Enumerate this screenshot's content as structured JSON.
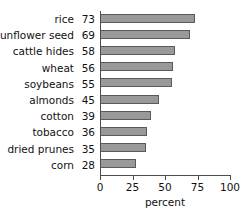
{
  "chart_data": {
    "type": "bar",
    "orientation": "horizontal",
    "title": "",
    "xlabel": "percent",
    "ylabel": "",
    "xlim": [
      0,
      100
    ],
    "xticks": [
      0,
      25,
      50,
      75,
      100
    ],
    "grid": false,
    "legend": null,
    "categories": [
      "rice",
      "sunflower seed",
      "cattle hides",
      "wheat",
      "soybeans",
      "almonds",
      "cotton",
      "tobacco",
      "dried prunes",
      "corn"
    ],
    "values": [
      73,
      69,
      58,
      56,
      55,
      45,
      39,
      36,
      35,
      28
    ],
    "rows": [
      {
        "category": "rice",
        "value": 73,
        "value_text": "73"
      },
      {
        "category": "sunflower seed",
        "value": 69,
        "value_text": "69"
      },
      {
        "category": "cattle hides",
        "value": 58,
        "value_text": "58"
      },
      {
        "category": "wheat",
        "value": 56,
        "value_text": "56"
      },
      {
        "category": "soybeans",
        "value": 55,
        "value_text": "55"
      },
      {
        "category": "almonds",
        "value": 45,
        "value_text": "45"
      },
      {
        "category": "cotton",
        "value": 39,
        "value_text": "39"
      },
      {
        "category": "tobacco",
        "value": 36,
        "value_text": "36"
      },
      {
        "category": "dried prunes",
        "value": 35,
        "value_text": "35"
      },
      {
        "category": "corn",
        "value": 28,
        "value_text": "28"
      }
    ],
    "tick_labels": [
      "0",
      "25",
      "50",
      "75",
      "100"
    ],
    "colors": {
      "bar_fill": "#999999",
      "bar_stroke": "#5a5a5a",
      "axis": "#4d4d4d",
      "text": "#111111",
      "background": "#ffffff"
    }
  }
}
